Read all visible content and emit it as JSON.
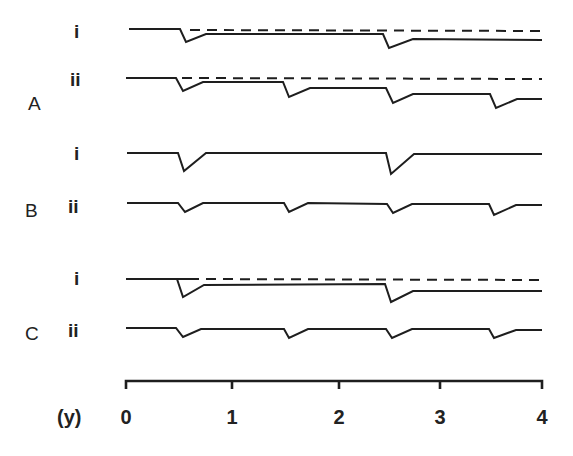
{
  "panels": [
    {
      "label": "A",
      "rows": [
        {
          "label": "i",
          "has_reference_line": true,
          "dips_at_years": [
            0.55,
            2.55
          ]
        },
        {
          "label": "ii",
          "has_reference_line": true,
          "dips_at_years": [
            0.55,
            1.55,
            2.55,
            3.55
          ]
        }
      ]
    },
    {
      "label": "B",
      "rows": [
        {
          "label": "i",
          "has_reference_line": false,
          "dips_at_years": [
            0.55,
            2.55
          ]
        },
        {
          "label": "ii",
          "has_reference_line": false,
          "dips_at_years": [
            0.55,
            1.55,
            2.55,
            3.55
          ]
        }
      ]
    },
    {
      "label": "C",
      "rows": [
        {
          "label": "i",
          "has_reference_line": true,
          "dips_at_years": [
            0.55,
            2.55
          ]
        },
        {
          "label": "ii",
          "has_reference_line": false,
          "dips_at_years": [
            0.55,
            1.55,
            2.55,
            3.55
          ]
        }
      ]
    }
  ],
  "axis": {
    "unit_label": "(y)",
    "ticks": [
      "0",
      "1",
      "2",
      "3",
      "4"
    ]
  }
}
